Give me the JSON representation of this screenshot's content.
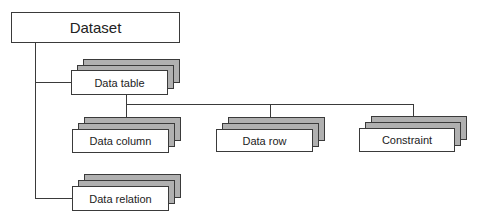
{
  "diagram": {
    "type": "hierarchy",
    "root": {
      "label": "Dataset"
    },
    "nodes": [
      {
        "id": "data-table",
        "label": "Data table",
        "parent": "Dataset",
        "stacked": true
      },
      {
        "id": "data-column",
        "label": "Data column",
        "parent": "Data table",
        "stacked": true
      },
      {
        "id": "data-row",
        "label": "Data row",
        "parent": "Data table",
        "stacked": true
      },
      {
        "id": "constraint",
        "label": "Constraint",
        "parent": "Data table",
        "stacked": true
      },
      {
        "id": "data-relation",
        "label": "Data relation",
        "parent": "Dataset",
        "stacked": true
      }
    ],
    "colors": {
      "line": "#3a3a3a",
      "box_fill": "#ffffff",
      "stack_fill": "#b0b0b0"
    }
  }
}
